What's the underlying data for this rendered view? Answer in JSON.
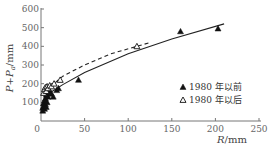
{
  "chart_data": {
    "type": "scatter",
    "title": "",
    "xlabel": "R/mm",
    "ylabel": "P+Pa/mm",
    "xlim": [
      0,
      250
    ],
    "ylim": [
      0,
      600
    ],
    "xticks": [
      0,
      50,
      100,
      150,
      200,
      250
    ],
    "yticks": [
      0,
      100,
      200,
      300,
      400,
      500,
      600
    ],
    "grid": false,
    "legend_position": "lower right",
    "series": [
      {
        "name": "1980 年以前",
        "marker": "filled-triangle",
        "color": "#111111",
        "points": [
          [
            2,
            55
          ],
          [
            2,
            70
          ],
          [
            3,
            80
          ],
          [
            3,
            95
          ],
          [
            4,
            65
          ],
          [
            4,
            110
          ],
          [
            5,
            90
          ],
          [
            5,
            120
          ],
          [
            6,
            75
          ],
          [
            6,
            140
          ],
          [
            7,
            100
          ],
          [
            7,
            155
          ],
          [
            8,
            130
          ],
          [
            9,
            170
          ],
          [
            10,
            160
          ],
          [
            12,
            145
          ],
          [
            14,
            130
          ],
          [
            18,
            165
          ],
          [
            20,
            175
          ],
          [
            43,
            220
          ],
          [
            160,
            480
          ],
          [
            203,
            495
          ]
        ],
        "fit": {
          "style": "solid",
          "x": [
            0,
            10,
            25,
            50,
            100,
            150,
            210
          ],
          "y": [
            60,
            150,
            195,
            260,
            360,
            440,
            520
          ]
        }
      },
      {
        "name": "1980 年以后",
        "marker": "open-triangle",
        "color": "#111111",
        "points": [
          [
            3,
            150
          ],
          [
            4,
            170
          ],
          [
            5,
            180
          ],
          [
            6,
            160
          ],
          [
            7,
            185
          ],
          [
            8,
            175
          ],
          [
            10,
            190
          ],
          [
            12,
            185
          ],
          [
            15,
            200
          ],
          [
            22,
            220
          ],
          [
            110,
            400
          ]
        ],
        "fit": {
          "style": "dashed",
          "x": [
            0,
            10,
            25,
            50,
            80,
            125
          ],
          "y": [
            80,
            180,
            240,
            300,
            360,
            420
          ]
        }
      }
    ]
  },
  "axes": {
    "ylabel_main": "P+P",
    "ylabel_sub": "a",
    "ylabel_unit": "/mm",
    "xlabel_main": "R",
    "xlabel_unit": "/mm"
  },
  "legend": {
    "items": [
      {
        "symbol": "▲",
        "label": "1980 年以前"
      },
      {
        "symbol": "△",
        "label": "1980 年以后"
      }
    ]
  }
}
